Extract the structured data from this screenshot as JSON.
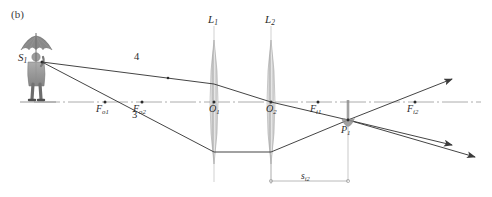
{
  "figure": {
    "panel_label": "(b)",
    "caption_note": "",
    "width": 492,
    "height": 197
  },
  "colors": {
    "axis": "#9a9a9a",
    "ray": "#3a3a3a",
    "lens_body": "#b9b9b9",
    "lens_edge": "#8f8f8f",
    "lens_axis": "#b5b5b5",
    "dim_line": "#a8a8a8",
    "person": "#8a8a8a",
    "text": "#2b2b2b",
    "background": "#ffffff"
  },
  "axis": {
    "label": "optical-axis",
    "y": 102,
    "x_start": 34,
    "x_end": 481
  },
  "object": {
    "label": "S",
    "sub": "1",
    "x": 42,
    "y": 62,
    "description": "person-with-umbrella"
  },
  "lenses": [
    {
      "name": "L",
      "sub": "1",
      "label_x": 211,
      "label_y": 20,
      "center_x": 214,
      "center_y": 102,
      "half_height": 62,
      "max_half_width": 6
    },
    {
      "name": "L",
      "sub": "2",
      "label_x": 268,
      "label_y": 20,
      "center_x": 271,
      "center_y": 102,
      "half_height": 62,
      "max_half_width": 6
    }
  ],
  "optical_centers": [
    {
      "name": "O",
      "sub": "1",
      "x": 214,
      "y": 102,
      "label_x": 210,
      "label_y": 106
    },
    {
      "name": "O",
      "sub": "2",
      "x": 271,
      "y": 102,
      "label_x": 267,
      "label_y": 106
    }
  ],
  "focal_points": [
    {
      "name": "F",
      "sub": "o1",
      "x": 105,
      "y": 102,
      "label_x": 96,
      "label_y": 106
    },
    {
      "name": "F",
      "sub": "o2",
      "x": 142,
      "y": 102,
      "label_x": 133,
      "label_y": 106
    },
    {
      "name": "F",
      "sub": "i1",
      "x": 318,
      "y": 102,
      "label_x": 309,
      "label_y": 106
    },
    {
      "name": "F",
      "sub": "i2",
      "x": 415,
      "y": 102,
      "label_x": 406,
      "label_y": 106
    }
  ],
  "image_point": {
    "name": "P",
    "sub": "1",
    "x": 348,
    "y": 120,
    "label_x": 342,
    "label_y": 126,
    "description": "inverted-image-umbrella"
  },
  "rays": [
    {
      "id": "ray-4",
      "label": "4",
      "label_x": 136,
      "label_y": 58,
      "points": "42,62 214,84 271,102 348,120 455,146",
      "arrow_at": "455,146"
    },
    {
      "id": "ray-3",
      "label": "3",
      "label_x": 134,
      "label_y": 115,
      "points": "42,62 214,152 271,152 348,120 478,158",
      "arrow_at": "478,158"
    },
    {
      "id": "ray-through-center",
      "label": "",
      "label_x": 0,
      "label_y": 0,
      "points": "348,120 455,77",
      "arrow_at": "455,77"
    }
  ],
  "dimension": {
    "name": "s",
    "sub": "i2",
    "label_x": 302,
    "label_y": 174,
    "x_start": 271,
    "x_end": 348,
    "y": 181,
    "tick_top": 155
  }
}
